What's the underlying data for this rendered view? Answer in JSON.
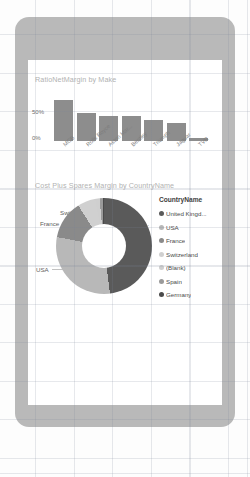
{
  "device": {
    "frame_color": "#b9b9b9",
    "screen_color": "#ffffff"
  },
  "bar_chart": {
    "title": "RatioNetMargin by Make",
    "y_ticks": [
      "50%",
      "0%"
    ],
    "bar_color": "#8d8d8d"
  },
  "donut_chart": {
    "title": "Cost Plus Spares Margin by CountryName",
    "callouts": {
      "switzerland": "Switzerland",
      "france": "France",
      "usa": "USA",
      "united": "United..."
    },
    "legend_title": "CountryName",
    "legend": [
      {
        "label": "United Kingd...",
        "color": "#5a5a5a"
      },
      {
        "label": "USA",
        "color": "#b8b8b8"
      },
      {
        "label": "France",
        "color": "#8a8a8a"
      },
      {
        "label": "Switzerland",
        "color": "#d0d0d0"
      },
      {
        "label": "(Blank)",
        "color": "#cfcfcf"
      },
      {
        "label": "Spain",
        "color": "#9a9a9a"
      },
      {
        "label": "Germany",
        "color": "#4a4a4a"
      }
    ]
  },
  "chart_data": [
    {
      "type": "bar",
      "title": "RatioNetMargin by Make",
      "xlabel": "Make",
      "ylabel": "RatioNetMargin",
      "categories": [
        "MGB",
        "Rolls Royce",
        "Aston Mar...",
        "Bentley",
        "Triumph",
        "Jaguar",
        "TVR"
      ],
      "values": [
        0.55,
        0.38,
        0.33,
        0.33,
        0.28,
        0.24,
        0.04
      ],
      "tick_labels": [
        "50%",
        "0%"
      ],
      "ylim": [
        0,
        0.6
      ],
      "grid": false,
      "legend": "none"
    },
    {
      "type": "pie",
      "title": "Cost Plus Spares Margin by CountryName",
      "labels": [
        "United Kingd...",
        "USA",
        "France",
        "Switzerland",
        "(Blank)",
        "Spain",
        "Germany"
      ],
      "values": [
        48,
        30,
        13,
        6,
        1.5,
        1,
        0.5
      ],
      "colors": [
        "#5a5a5a",
        "#b8b8b8",
        "#8a8a8a",
        "#d0d0d0",
        "#cfcfcf",
        "#9a9a9a",
        "#4a4a4a"
      ],
      "donut": true,
      "legend": "right",
      "legend_title": "CountryName"
    }
  ]
}
